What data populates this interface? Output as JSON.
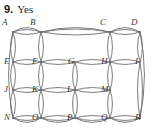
{
  "header": {
    "question_number": "9.",
    "answer": "Yes"
  },
  "figure": {
    "name": "planar-graph-grid",
    "stroke_color": "#6e6e6e",
    "label_color": "#3b3b3b",
    "background": "#ffffff",
    "columns_x": [
      13,
      41,
      75,
      110,
      140
    ],
    "rows_y": [
      14,
      44,
      72,
      100
    ],
    "vertices": [
      {
        "id": "A",
        "label": "A",
        "col": 0,
        "row": 0,
        "lx": 2,
        "ly": 0,
        "label_above": true
      },
      {
        "id": "B",
        "label": "B",
        "col": 1,
        "row": 0,
        "lx": 30,
        "ly": 0,
        "label_above": true
      },
      {
        "id": "C",
        "label": "C",
        "col": 3,
        "row": 0,
        "lx": 100,
        "ly": 0,
        "label_above": true
      },
      {
        "id": "D",
        "label": "D",
        "col": 4,
        "row": 0,
        "lx": 131,
        "ly": 0,
        "label_above": true
      },
      {
        "id": "E",
        "label": "E",
        "col": 0,
        "row": 1,
        "lx": 4,
        "ly": 39,
        "label_above": false
      },
      {
        "id": "F",
        "label": "F",
        "col": 1,
        "row": 1,
        "lx": 32,
        "ly": 39,
        "label_above": false
      },
      {
        "id": "H",
        "label": "H",
        "col": 3,
        "row": 1,
        "lx": 101,
        "ly": 39,
        "label_above": false
      },
      {
        "id": "I",
        "label": "I",
        "col": 4,
        "row": 1,
        "lx": 135,
        "ly": 39,
        "label_above": false
      },
      {
        "id": "J",
        "label": "J",
        "col": 0,
        "row": 2,
        "lx": 4,
        "ly": 67,
        "label_above": false
      },
      {
        "id": "K",
        "label": "K",
        "col": 1,
        "row": 2,
        "lx": 32,
        "ly": 67,
        "label_above": false
      },
      {
        "id": "L",
        "label": "L",
        "col": 2,
        "row": 2,
        "lx": 67,
        "ly": 67,
        "label_above": false
      },
      {
        "id": "M",
        "label": "M",
        "col": 3,
        "row": 2,
        "lx": 101,
        "ly": 67,
        "label_above": false
      },
      {
        "id": "N",
        "label": "N",
        "col": 0,
        "row": 3,
        "lx": 4,
        "ly": 95,
        "label_above": false
      },
      {
        "id": "O",
        "label": "O",
        "col": 1,
        "row": 3,
        "lx": 32,
        "ly": 95,
        "label_above": false
      },
      {
        "id": "P",
        "label": "P",
        "col": 2,
        "row": 3,
        "lx": 67,
        "ly": 95,
        "label_above": false
      },
      {
        "id": "Q",
        "label": "Q",
        "col": 3,
        "row": 3,
        "lx": 101,
        "ly": 95,
        "label_above": false
      },
      {
        "id": "R",
        "label": "R",
        "col": 4,
        "row": 3,
        "lx": 135,
        "ly": 95,
        "label_above": false
      }
    ],
    "region_labels": [
      {
        "id": "G",
        "label": "G",
        "lx": 68,
        "ly": 39
      }
    ],
    "horizontal_lens_edges": [
      {
        "from": "A",
        "to": "B",
        "y": 14,
        "x1": 13,
        "x2": 41,
        "bulge": 5
      },
      {
        "from": "B",
        "to": "C",
        "y": 14,
        "x1": 41,
        "x2": 110,
        "bulge": 6
      },
      {
        "from": "C",
        "to": "D",
        "y": 14,
        "x1": 110,
        "x2": 140,
        "bulge": 5
      },
      {
        "from": "E",
        "to": "F",
        "y": 44,
        "x1": 13,
        "x2": 41,
        "bulge": 5
      },
      {
        "from": "F",
        "to": "G",
        "y": 44,
        "x1": 41,
        "x2": 75,
        "bulge": 5
      },
      {
        "from": "G",
        "to": "H",
        "y": 44,
        "x1": 75,
        "x2": 110,
        "bulge": 5
      },
      {
        "from": "H",
        "to": "I",
        "y": 44,
        "x1": 110,
        "x2": 140,
        "bulge": 5
      },
      {
        "from": "J",
        "to": "K",
        "y": 72,
        "x1": 13,
        "x2": 41,
        "bulge": 5
      },
      {
        "from": "K",
        "to": "L",
        "y": 72,
        "x1": 41,
        "x2": 75,
        "bulge": 5
      },
      {
        "from": "L",
        "to": "M",
        "y": 72,
        "x1": 75,
        "x2": 110,
        "bulge": 5
      },
      {
        "from": "N",
        "to": "O",
        "y": 100,
        "x1": 13,
        "x2": 41,
        "bulge": 5
      },
      {
        "from": "O",
        "to": "P",
        "y": 100,
        "x1": 41,
        "x2": 75,
        "bulge": 5
      },
      {
        "from": "P",
        "to": "Q",
        "y": 100,
        "x1": 75,
        "x2": 110,
        "bulge": 5
      },
      {
        "from": "Q",
        "to": "R",
        "y": 100,
        "x1": 110,
        "x2": 140,
        "bulge": 5
      }
    ],
    "vertical_lens_edges": [
      {
        "from": "A",
        "to": "E",
        "x": 13,
        "y1": 14,
        "y2": 44,
        "bulge": 5
      },
      {
        "from": "B",
        "to": "F",
        "x": 41,
        "y1": 14,
        "y2": 44,
        "bulge": 5
      },
      {
        "from": "C",
        "to": "H",
        "x": 110,
        "y1": 14,
        "y2": 44,
        "bulge": 5
      },
      {
        "from": "D",
        "to": "I",
        "x": 140,
        "y1": 14,
        "y2": 44,
        "bulge": 5
      },
      {
        "from": "E",
        "to": "J",
        "x": 13,
        "y1": 44,
        "y2": 72,
        "bulge": 5
      },
      {
        "from": "F",
        "to": "K",
        "x": 41,
        "y1": 44,
        "y2": 72,
        "bulge": 5
      },
      {
        "from": "G",
        "to": "L",
        "x": 75,
        "y1": 44,
        "y2": 72,
        "bulge": 5
      },
      {
        "from": "H",
        "to": "M",
        "x": 110,
        "y1": 44,
        "y2": 72,
        "bulge": 5
      },
      {
        "from": "I",
        "to": "R",
        "x": 140,
        "y1": 44,
        "y2": 100,
        "bulge": 5
      },
      {
        "from": "J",
        "to": "N",
        "x": 13,
        "y1": 72,
        "y2": 100,
        "bulge": 5
      },
      {
        "from": "K",
        "to": "O",
        "x": 41,
        "y1": 72,
        "y2": 100,
        "bulge": 5
      },
      {
        "from": "L",
        "to": "P",
        "x": 75,
        "y1": 72,
        "y2": 100,
        "bulge": 5
      },
      {
        "from": "M",
        "to": "Q",
        "x": 110,
        "y1": 72,
        "y2": 100,
        "bulge": 5
      }
    ],
    "outer_boundary": {
      "top_y": 14,
      "bottom_y": 100,
      "left_x": 13,
      "right_x": 140,
      "outer_bulge": 9
    }
  }
}
